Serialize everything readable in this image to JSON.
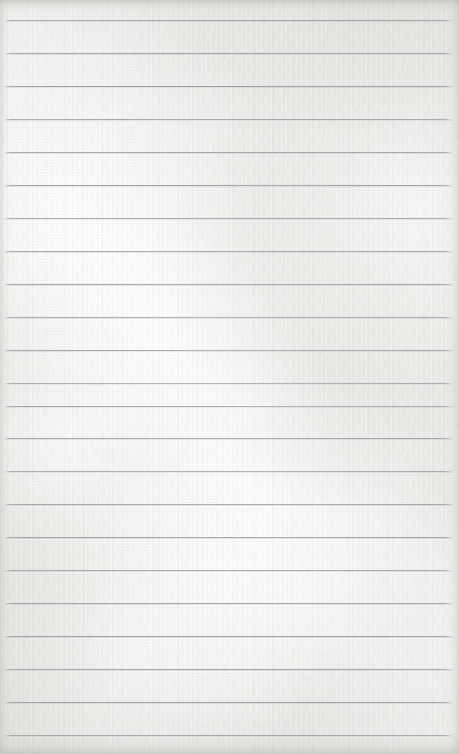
{
  "document": {
    "kind": "scanned-ruled-paper",
    "title": "",
    "visible_text": "",
    "handwriting": "",
    "page_number": "",
    "notes": "Blank ruled notebook page; no text, headings, numbers or marks are rendered in the pixels."
  },
  "canvas": {
    "width": 459,
    "height": 754
  },
  "paper": {
    "base_color": "#efefec",
    "highlight_color": "#ffffff",
    "shade_color": "#d5d5d1",
    "texture": "mottled-fiber"
  },
  "rules": {
    "color": "#8f949a",
    "thickness": 1,
    "first_line_y": 20,
    "spacing": 33,
    "left_x": 5,
    "right_x": 452,
    "count": 22,
    "lines_y": [
      20,
      53,
      86,
      119,
      152,
      185,
      218,
      251,
      284,
      317,
      350,
      383,
      406,
      438,
      471,
      504,
      537,
      570,
      603,
      636,
      669,
      702,
      735
    ]
  },
  "edges": {
    "top_shadow_color": "#b0b0ac",
    "bottom_shadow_color": "#b2b2ae",
    "left_shadow_color": "#bababa",
    "right_shadow_color": "#b7b7b3"
  }
}
